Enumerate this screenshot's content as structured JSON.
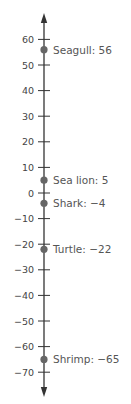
{
  "chart_data": {
    "type": "scatter",
    "orientation": "vertical-number-line",
    "title": "",
    "xlabel": "",
    "ylabel": "",
    "ylim": [
      -70,
      60
    ],
    "ticks": [
      60,
      50,
      40,
      30,
      20,
      10,
      0,
      -10,
      -20,
      -30,
      -40,
      -50,
      -60,
      -70
    ],
    "tick_labels": [
      "60",
      "50",
      "40",
      "30",
      "20",
      "10",
      "0",
      "−10",
      "−20",
      "−30",
      "−40",
      "−50",
      "−60",
      "−70"
    ],
    "grid": false,
    "legend": null,
    "points": [
      {
        "name": "Seagull",
        "value": 56,
        "label": "Seagull: 56"
      },
      {
        "name": "Sea lion",
        "value": 5,
        "label": "Sea lion: 5"
      },
      {
        "name": "Shark",
        "value": -4,
        "label": "Shark: −4"
      },
      {
        "name": "Turtle",
        "value": -22,
        "label": "Turtle: −22"
      },
      {
        "name": "Shrimp",
        "value": -65,
        "label": "Shrimp: −65"
      }
    ],
    "colors": {
      "axis": "#333333",
      "point": "#666666",
      "text": "#555555"
    }
  }
}
